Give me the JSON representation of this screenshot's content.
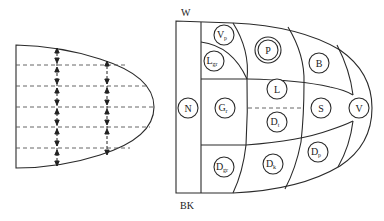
{
  "left_diagram": {
    "description": "Parabolic organ outline with horizontal dashed lines and vertical double-headed arrows",
    "dashed_line_count": 5,
    "arrow_columns": 2
  },
  "right_diagram": {
    "top_label": "W",
    "bottom_label": "BK",
    "regions": [
      {
        "id": "N",
        "main": "N",
        "sub": ""
      },
      {
        "id": "Vp",
        "main": "V",
        "sub": "p"
      },
      {
        "id": "Lgr",
        "main": "L",
        "sub": "gr"
      },
      {
        "id": "P",
        "main": "P",
        "sub": "",
        "double_circle": true
      },
      {
        "id": "B",
        "main": "B",
        "sub": ""
      },
      {
        "id": "Gr",
        "main": "G",
        "sub": "r"
      },
      {
        "id": "L",
        "main": "L",
        "sub": ""
      },
      {
        "id": "Dt",
        "main": "D",
        "sub": "t"
      },
      {
        "id": "S",
        "main": "S",
        "sub": ""
      },
      {
        "id": "V",
        "main": "V",
        "sub": ""
      },
      {
        "id": "Dgr",
        "main": "D",
        "sub": "gr"
      },
      {
        "id": "Dk",
        "main": "D",
        "sub": "k"
      },
      {
        "id": "Dp",
        "main": "D",
        "sub": "p"
      }
    ]
  }
}
